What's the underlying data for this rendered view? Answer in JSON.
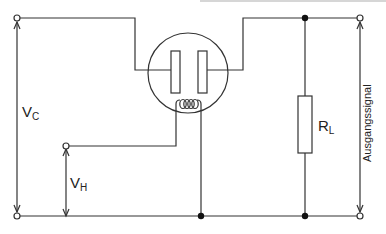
{
  "labels": {
    "vc_main": "V",
    "vc_sub": "C",
    "vh_main": "V",
    "vh_sub": "H",
    "rl_main": "R",
    "rl_sub": "L",
    "output": "Ausgangssignal"
  },
  "colors": {
    "wire": "#333333",
    "background": "#ffffff",
    "top_edge": "#cfcfcf"
  }
}
